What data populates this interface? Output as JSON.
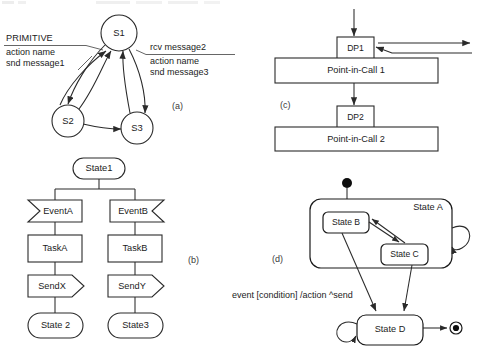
{
  "figure": {
    "caption_labels": {
      "a": "(a)",
      "b": "(b)",
      "c": "(c)",
      "d": "(d)"
    }
  },
  "panel_a": {
    "title": "State transition graph",
    "nodes": [
      {
        "id": "S1",
        "label": "S1"
      },
      {
        "id": "S2",
        "label": "S2"
      },
      {
        "id": "S3",
        "label": "S3"
      }
    ],
    "note_left": {
      "header": "PRIMITIVE",
      "line1": "action name",
      "line2": "snd message1"
    },
    "note_right": {
      "header": "rcv message2",
      "line1": "action name",
      "line2": "snd message3"
    }
  },
  "panel_b": {
    "title": "SDL process flow",
    "root": "State1",
    "branches": [
      {
        "event": "EventA",
        "task": "TaskA",
        "send": "SendX",
        "next_state": "State 2"
      },
      {
        "event": "EventB",
        "task": "TaskB",
        "send": "SendY",
        "next_state": "State3"
      }
    ]
  },
  "panel_c": {
    "title": "Detection points and points in call",
    "blocks": [
      {
        "dp": "DP1",
        "pic": "Point-in-Call 1"
      },
      {
        "dp": "DP2",
        "pic": "Point-in-Call 2"
      }
    ]
  },
  "panel_d": {
    "title": "UML statechart",
    "superstate": "State A",
    "substates": [
      "State B",
      "State C"
    ],
    "external_state": "State D",
    "transition_label": "event [condition] /action ^send"
  }
}
